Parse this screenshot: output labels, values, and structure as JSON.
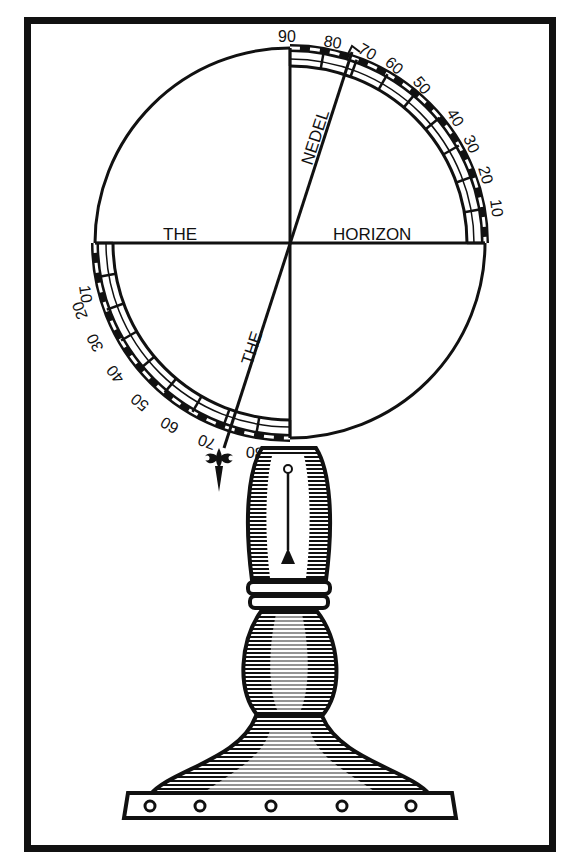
{
  "diagram": {
    "style": "woodcut line illustration",
    "colors": {
      "ink": "#111111",
      "paper": "#ffffff"
    },
    "labels": {
      "horizon_left": "THE",
      "horizon_right": "HORIZON",
      "needle_upper": "NEDEL",
      "needle_lower": "THE"
    },
    "upper_scale": {
      "top": "90",
      "ticks": [
        "80",
        "70",
        "60",
        "50",
        "40",
        "30",
        "20",
        "10"
      ]
    },
    "lower_scale": {
      "ticks": [
        "10",
        "20",
        "30",
        "40",
        "50",
        "60",
        "70",
        "80"
      ],
      "bottom": "90"
    },
    "parts": [
      "circular dial",
      "horizon line",
      "vertical axis",
      "magnetic needle",
      "graduated quadrant arcs",
      "fleur-de-lis needle tip",
      "plumb bob",
      "baluster stand",
      "collar ring",
      "bell base",
      "plinth with studs"
    ]
  }
}
